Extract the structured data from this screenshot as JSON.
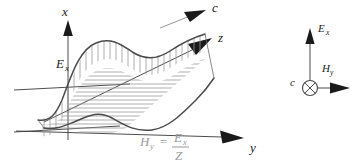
{
  "figure": {
    "background_color": "#ffffff"
  },
  "axes": {
    "x": {
      "label": "x",
      "description": "vertical axis, electric field direction"
    },
    "y": {
      "label": "y",
      "description": "axis toward lower right, magnetic field direction"
    },
    "z": {
      "label": "z",
      "description": "axis toward upper right, propagation direction"
    }
  },
  "propagation": {
    "label": "c",
    "description": "speed of light arrow parallel to z axis"
  },
  "field_labels": {
    "electric": "E",
    "electric_subscript": "x",
    "magnetic": "H",
    "magnetic_subscript": "y"
  },
  "equation": {
    "lhs_symbol": "H",
    "lhs_subscript": "y",
    "equals": "=",
    "numerator_symbol": "E",
    "numerator_subscript": "x",
    "denominator": "Z",
    "plain_text": "H_y = E_x / Z",
    "color": "#9a9a9a"
  },
  "inset": {
    "title": "transverse field orientation",
    "propagation_label": "c",
    "propagation_note": "into the page",
    "electric_symbol": "E",
    "electric_subscript": "x",
    "magnetic_symbol": "H",
    "magnetic_subscript": "y"
  },
  "colors": {
    "curve": "#4a4a4a",
    "axis": "#3a3a3a",
    "hatch": "#9a9a9a",
    "label": "#1a1a1a",
    "gray_label": "#9a9a9a"
  }
}
